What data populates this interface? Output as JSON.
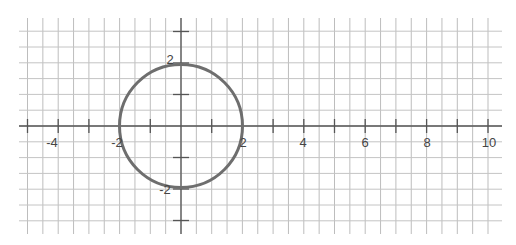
{
  "figure": {
    "equation": "x^2 + y^2 = 4",
    "center": [
      0,
      0
    ],
    "radius": 2,
    "colors": {
      "grid": "#bdbdbd",
      "axis": "#555555",
      "curve": "#6e6e6e",
      "labels": "#444444"
    }
  },
  "axes": {
    "x_tick_labels": [
      "-4",
      "-2",
      "2",
      "4",
      "6",
      "8",
      "10"
    ],
    "x_tick_values": [
      -4,
      -2,
      2,
      4,
      6,
      8,
      10
    ],
    "y_tick_labels": [
      "2",
      "-2"
    ],
    "y_tick_values": [
      2,
      -2
    ],
    "x_range": [
      -5,
      10.5
    ],
    "y_range": [
      -3.5,
      3.5
    ],
    "grid_step": 0.5
  }
}
